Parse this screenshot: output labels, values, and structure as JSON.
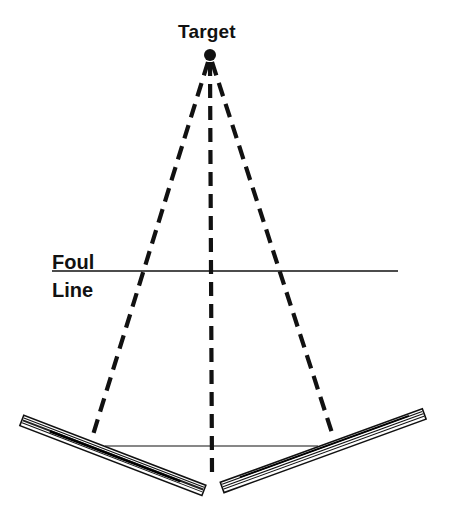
{
  "diagram": {
    "labels": {
      "target": "Target",
      "foul": "Foul",
      "line": "Line"
    },
    "colors": {
      "ink": "#111111",
      "background": "#ffffff"
    },
    "target_point": {
      "x": 210,
      "y": 55
    },
    "foul_line": {
      "x1": 52,
      "x2": 398,
      "y": 271
    },
    "sight_lines": [
      {
        "name": "left",
        "x2": 92,
        "y2": 438
      },
      {
        "name": "center",
        "x2": 212,
        "y2": 472
      },
      {
        "name": "right",
        "x2": 333,
        "y2": 436
      }
    ],
    "boards": [
      {
        "name": "left-board",
        "x1": 22,
        "y1": 420,
        "x2": 204,
        "y2": 490
      },
      {
        "name": "right-board",
        "x1": 222,
        "y1": 487,
        "x2": 424,
        "y2": 414
      }
    ],
    "connector_line": {
      "x1": 105,
      "x2": 318,
      "y": 446
    }
  }
}
